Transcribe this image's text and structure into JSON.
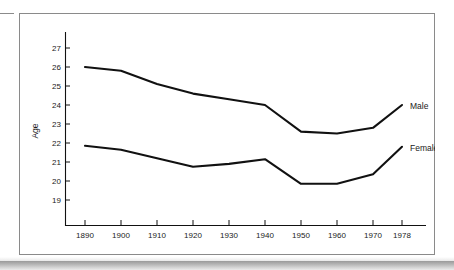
{
  "chart_data": {
    "type": "line",
    "title": "",
    "xlabel": "",
    "ylabel": "Age",
    "x": [
      1890,
      1900,
      1910,
      1920,
      1930,
      1940,
      1950,
      1960,
      1970,
      1978
    ],
    "categories": [
      "1890",
      "1900",
      "1910",
      "1920",
      "1930",
      "1940",
      "1950",
      "1960",
      "1970",
      "1978"
    ],
    "xtick_labels": [
      "1890",
      "1900",
      "1910",
      "1920",
      "1930",
      "1940",
      "1950",
      "1960",
      "1970",
      "1978"
    ],
    "ytick_labels": [
      "19",
      "20",
      "21",
      "22",
      "23",
      "24",
      "25",
      "26",
      "27"
    ],
    "ytick_values": [
      19,
      20,
      21,
      22,
      23,
      24,
      25,
      26,
      27
    ],
    "ylim": [
      18.3,
      27.8
    ],
    "xlim": [
      1885,
      1986
    ],
    "grid": false,
    "legend_position": "right-inline-labels",
    "series": [
      {
        "name": "Male",
        "label": "Male",
        "color": "#111111",
        "values": [
          26.0,
          25.8,
          25.1,
          24.6,
          24.3,
          24.0,
          22.6,
          22.5,
          22.8,
          24.0
        ]
      },
      {
        "name": "Female",
        "label": "Female",
        "color": "#111111",
        "values": [
          21.85,
          21.65,
          21.2,
          20.75,
          20.9,
          21.15,
          19.85,
          19.85,
          20.35,
          21.8
        ]
      }
    ],
    "annotations": [
      {
        "text": "Male",
        "x": 1978,
        "y": 24.0
      },
      {
        "text": "Female",
        "x": 1978,
        "y": 21.8
      }
    ]
  },
  "axis": {
    "y_title": "Age"
  }
}
